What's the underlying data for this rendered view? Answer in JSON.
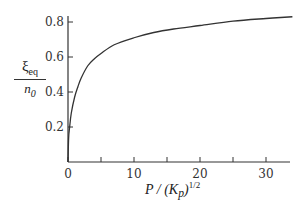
{
  "chart_data": {
    "type": "line",
    "title": "",
    "xlabel": "P / (K_p)^1/2",
    "ylabel": "ξ_eq / n_0",
    "xlim": [
      0,
      34
    ],
    "ylim": [
      0,
      0.85
    ],
    "xticks": [
      0,
      5,
      10,
      15,
      20,
      25,
      30
    ],
    "xtick_labels": [
      "0",
      "",
      "10",
      "",
      "20",
      "",
      "30"
    ],
    "yticks": [
      0.2,
      0.4,
      0.6,
      0.8
    ],
    "ytick_labels": [
      "0.2",
      "0.4",
      "0.6",
      "0.8"
    ],
    "grid": false,
    "legend": null,
    "series": [
      {
        "name": "ξ_eq/n_0",
        "x": [
          0,
          0.1,
          0.25,
          0.5,
          1,
          1.5,
          2,
          3,
          4,
          5,
          7,
          10,
          13,
          16,
          20,
          25,
          30,
          34
        ],
        "y": [
          0,
          0.14,
          0.2,
          0.28,
          0.37,
          0.43,
          0.48,
          0.55,
          0.59,
          0.62,
          0.67,
          0.71,
          0.74,
          0.76,
          0.78,
          0.805,
          0.82,
          0.83
        ]
      }
    ]
  },
  "labels": {
    "ylabel_num": "ξ",
    "ylabel_num_sub": "eq",
    "ylabel_den": "n",
    "ylabel_den_sub": "0",
    "xlabel_main": "P / (K",
    "xlabel_sub": "p",
    "xlabel_close": ")",
    "xlabel_sup": "1/2"
  }
}
